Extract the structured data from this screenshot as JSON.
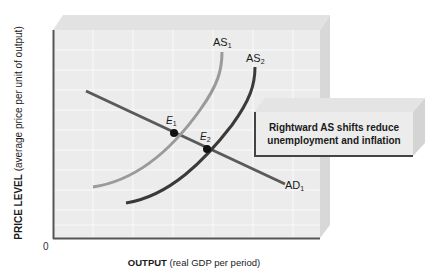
{
  "diagram": {
    "type": "aggregate-supply-demand",
    "y_axis": {
      "title_bold": "PRICE LEVEL",
      "title_rest": "(average price per unit of output)"
    },
    "x_axis": {
      "title_bold": "OUTPUT",
      "title_rest": "(real GDP per period)"
    },
    "origin_label": "0",
    "curves": [
      {
        "id": "AS1",
        "base": "AS",
        "sub": "1",
        "color": "#9a9a9a"
      },
      {
        "id": "AS2",
        "base": "AS",
        "sub": "2",
        "color": "#3a3a3a"
      },
      {
        "id": "AD1",
        "base": "AD",
        "sub": "1",
        "color": "#5a5a5a"
      }
    ],
    "points": [
      {
        "id": "E1",
        "base": "E",
        "sub": "1"
      },
      {
        "id": "E2",
        "base": "E",
        "sub": "2"
      }
    ],
    "callout": {
      "line1": "Rightward AS shifts reduce",
      "line2": "unemployment and inflation"
    },
    "colors": {
      "panel": "#ececec",
      "grid": "#f8f8f8",
      "axis": "#555555",
      "bevel_top": "#e2e2e2",
      "bevel_side": "#d6d6d6"
    }
  }
}
